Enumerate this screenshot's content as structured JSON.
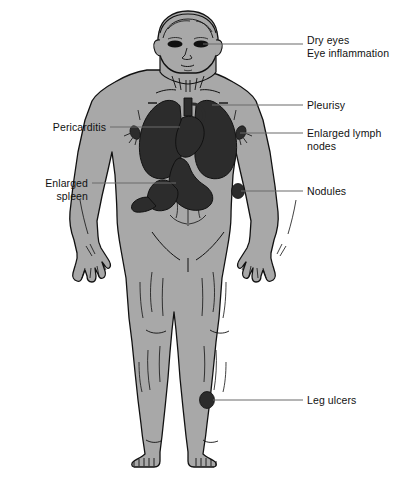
{
  "figure": {
    "title_partial": "",
    "caption": "",
    "width": 405,
    "height": 482,
    "background": "#ffffff",
    "body_fill": "#a8a8a8",
    "organ_fill": "#2c2c2c",
    "outline": "#111111",
    "leader_color": "#6a6a6a",
    "text_color": "#111111"
  },
  "labels": {
    "dry_eyes": {
      "text": "Dry eyes\nEye inflammation",
      "side": "right",
      "x": 307,
      "y": 40,
      "leader": {
        "x1": 203,
        "y1": 44,
        "x2": 303,
        "y2": 44
      }
    },
    "pleurisy": {
      "text": "Pleurisy",
      "side": "right",
      "x": 307,
      "y": 100,
      "leader": {
        "x1": 212,
        "y1": 105,
        "x2": 303,
        "y2": 105
      }
    },
    "enlarged_lymph_nodes": {
      "text": "Enlarged lymph\nnodes",
      "side": "right",
      "x": 307,
      "y": 128,
      "leader": {
        "x1": 240,
        "y1": 133,
        "x2": 303,
        "y2": 133
      }
    },
    "nodules": {
      "text": "Nodules",
      "side": "right",
      "x": 307,
      "y": 187,
      "leader": {
        "x1": 241,
        "y1": 191,
        "x2": 303,
        "y2": 191
      }
    },
    "leg_ulcers": {
      "text": "Leg ulcers",
      "side": "right",
      "x": 307,
      "y": 396,
      "leader": {
        "x1": 213,
        "y1": 400,
        "x2": 303,
        "y2": 400
      }
    },
    "pericarditis": {
      "text": "Pericarditis",
      "side": "left",
      "x": 6,
      "y": 122,
      "width": 100,
      "leader": {
        "x1": 110,
        "y1": 127,
        "x2": 177,
        "y2": 127
      }
    },
    "enlarged_spleen": {
      "text": "Enlarged\nspleen",
      "side": "left",
      "x": 6,
      "y": 178,
      "width": 82,
      "leader": {
        "x1": 92,
        "y1": 183,
        "x2": 174,
        "y2": 183
      }
    }
  },
  "anatomy": {
    "figure_name": "human-body-front-view",
    "organs": [
      {
        "name": "eyes",
        "kind": "marker"
      },
      {
        "name": "lungs",
        "kind": "organ"
      },
      {
        "name": "heart-pericardium",
        "kind": "organ"
      },
      {
        "name": "stomach",
        "kind": "organ"
      },
      {
        "name": "spleen",
        "kind": "organ"
      },
      {
        "name": "lymph-node-axilla-left",
        "kind": "marker"
      },
      {
        "name": "lymph-node-axilla-right",
        "kind": "marker"
      },
      {
        "name": "nodule-elbow",
        "kind": "marker"
      },
      {
        "name": "leg-ulcer",
        "kind": "marker"
      }
    ]
  }
}
